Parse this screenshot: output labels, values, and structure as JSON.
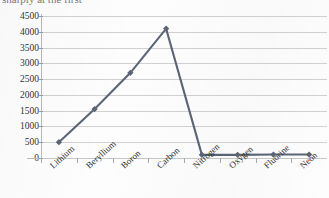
{
  "chart_data": {
    "type": "line",
    "title": "sharply at the first",
    "xlabel": "",
    "ylabel": "",
    "categories": [
      "Lithium",
      "Beryllium",
      "Boron",
      "Carbon",
      "Nitrogen",
      "Oxygen",
      "Fluorine",
      "Neon"
    ],
    "series": [
      {
        "name": "Ionization energy",
        "values": [
          500,
          1550,
          2700,
          4100,
          100,
          100,
          110,
          110
        ]
      }
    ],
    "ylim": [
      0,
      4500
    ],
    "ytick_values": [
      0,
      500,
      1000,
      1500,
      2000,
      2500,
      3000,
      3500,
      4000,
      4500
    ],
    "ytick_labels": [
      "0",
      "500",
      "1000",
      "1500",
      "2000",
      "2500",
      "3000",
      "3500",
      "4000",
      "4500"
    ],
    "grid": "horizontal",
    "legend": "none",
    "marker": "diamond",
    "colors": {
      "series": "#5b6576",
      "gridline": "#c9c9c9",
      "axis": "#b9b9b9",
      "text": "#2f2f2f",
      "background": "#fdfdfd"
    }
  }
}
